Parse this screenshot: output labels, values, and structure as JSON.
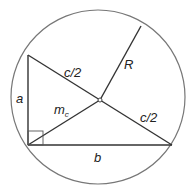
{
  "diagram": {
    "colors": {
      "line": "#333333",
      "circle": "#777777",
      "text": "#222222"
    },
    "labels": {
      "a": "a",
      "b": "b",
      "c_half_top": "c/2",
      "c_half_bottom": "c/2",
      "R": "R",
      "m": "m",
      "m_sub": "c"
    }
  }
}
